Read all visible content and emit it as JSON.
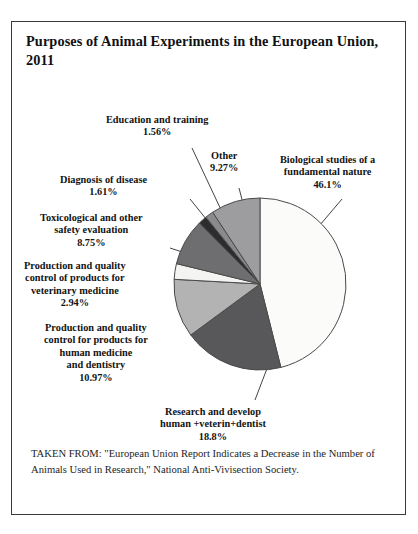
{
  "figure": {
    "title": "Purposes of Animal Experiments in the European Union, 2011",
    "source_note": "TAKEN FROM: \"European Union Report Indicates a Decrease in the Number of Animals Used in Research,\" National Anti-Vivisection Society."
  },
  "chart_data": {
    "type": "pie",
    "title": "Purposes of Animal Experiments in the European Union, 2011",
    "units": "percent",
    "start_angle_deg": 0,
    "direction": "clockwise",
    "legend": "none",
    "labels_position": "outside-with-leader-lines",
    "categories": [
      "Biological studies of a fundamental nature",
      "Research and develop human +veterin+dentist",
      "Production and quality control for products for human medicine and dentistry",
      "Production and quality control of products for veterinary medicine",
      "Toxicological  and other safety evaluation",
      "Diagnosis of disease",
      "Education and training",
      "Other"
    ],
    "values": [
      46.1,
      18.8,
      10.97,
      2.94,
      8.75,
      1.61,
      1.56,
      9.27
    ],
    "slices": [
      {
        "name": "Biological studies of a fundamental nature",
        "label_text": "Biological studies of a\nfundamental nature",
        "value": 46.1,
        "value_text": "46.1%",
        "color": "#fbfbfa",
        "label_x": 268,
        "label_y": 132,
        "leader": [
          [
            330,
            177
          ],
          [
            291,
            223
          ]
        ]
      },
      {
        "name": "Research and develop human +veterin+dentist",
        "label_text": "Research and develop\nhuman +veterin+dentist",
        "value": 18.8,
        "value_text": "18.8%",
        "color": "#58585a",
        "label_x": 148,
        "label_y": 384,
        "leader": [
          [
            243,
            378
          ],
          [
            259,
            336
          ]
        ]
      },
      {
        "name": "Production and quality control for products for human medicine and dentistry",
        "label_text": "Production and quality\ncontrol for products for\nhuman medicine\nand dentistry",
        "value": 10.97,
        "value_text": "10.97%",
        "color": "#b3b3b3",
        "label_x": 32,
        "label_y": 300,
        "leader": [
          [
            182,
            318
          ],
          [
            219,
            302
          ]
        ]
      },
      {
        "name": "Production and quality control of products for veterinary medicine",
        "label_text": "Production and quality\ncontrol of products for\nveterinary medicine",
        "value": 2.94,
        "value_text": "2.94%",
        "color": "#f4f4f2",
        "label_x": 12,
        "label_y": 238,
        "leader": [
          [
            178,
            260
          ],
          [
            221,
            269
          ]
        ]
      },
      {
        "name": "Toxicological  and other safety evaluation",
        "label_text": "Toxicological  and other\nsafety evaluation",
        "value": 8.75,
        "value_text": "8.75%",
        "color": "#6e6e70",
        "label_x": 28,
        "label_y": 190,
        "leader": [
          [
            158,
            226
          ],
          [
            216,
            245
          ]
        ]
      },
      {
        "name": "Diagnosis of disease",
        "label_text": "Diagnosis of disease",
        "value": 1.61,
        "value_text": "1.61%",
        "color": "#2c2c2e",
        "label_x": 48,
        "label_y": 152,
        "leader": [
          [
            178,
            177
          ],
          [
            219,
            228
          ]
        ]
      },
      {
        "name": "Education and training",
        "label_text": "Education and training",
        "value": 1.56,
        "value_text": "1.56%",
        "color": "#8a8a8c",
        "label_x": 94,
        "label_y": 92,
        "leader": [
          [
            180,
            126
          ],
          [
            226,
            224
          ]
        ]
      },
      {
        "name": "Other",
        "label_text": "Other",
        "value": 9.27,
        "value_text": "9.27%",
        "color": "#9d9d9f",
        "label_x": 198,
        "label_y": 128,
        "leader": [
          [
            227,
            166
          ],
          [
            240,
            216
          ]
        ]
      }
    ],
    "geometry": {
      "cx": 248,
      "cy": 262,
      "r": 86,
      "stroke": "#4a4a4a",
      "stroke_width": 1
    }
  }
}
